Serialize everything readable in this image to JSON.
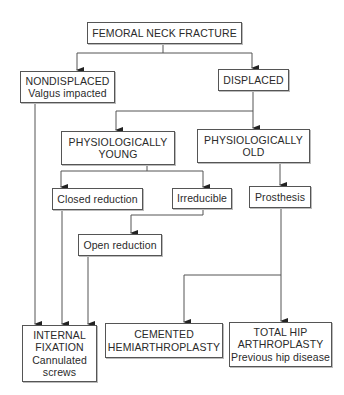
{
  "diagram": {
    "title": "FEMORAL NECK FRACTURE",
    "nodes": {
      "root": {
        "lines": [
          "FEMORAL NECK FRACTURE"
        ]
      },
      "nondisplaced": {
        "lines": [
          "NONDISPLACED",
          "Valgus impacted"
        ]
      },
      "displaced": {
        "lines": [
          "DISPLACED"
        ]
      },
      "young": {
        "lines": [
          "PHYSIOLOGICALLY",
          "YOUNG"
        ]
      },
      "old": {
        "lines": [
          "PHYSIOLOGICALLY",
          "OLD"
        ]
      },
      "closed_reduction": {
        "lines": [
          "Closed reduction"
        ]
      },
      "irreducible": {
        "lines": [
          "Irreducible"
        ]
      },
      "prosthesis": {
        "lines": [
          "Prosthesis"
        ]
      },
      "open_reduction": {
        "lines": [
          "Open reduction"
        ]
      },
      "internal_fixation": {
        "lines": [
          "INTERNAL",
          "FIXATION",
          "Cannulated",
          "screws"
        ]
      },
      "cemented": {
        "lines": [
          "CEMENTED",
          "HEMIARTHROPLASTY"
        ]
      },
      "total_hip": {
        "lines": [
          "TOTAL HIP",
          "ARTHROPLASTY",
          "Previous hip disease"
        ]
      }
    },
    "edges": [
      {
        "from": "root",
        "to": "nondisplaced"
      },
      {
        "from": "root",
        "to": "displaced"
      },
      {
        "from": "displaced",
        "to": "young"
      },
      {
        "from": "displaced",
        "to": "old"
      },
      {
        "from": "young",
        "to": "closed_reduction"
      },
      {
        "from": "young",
        "to": "irreducible"
      },
      {
        "from": "old",
        "to": "prosthesis"
      },
      {
        "from": "irreducible",
        "to": "open_reduction"
      },
      {
        "from": "nondisplaced",
        "to": "internal_fixation"
      },
      {
        "from": "closed_reduction",
        "to": "internal_fixation"
      },
      {
        "from": "open_reduction",
        "to": "internal_fixation"
      },
      {
        "from": "prosthesis",
        "to": "cemented"
      },
      {
        "from": "prosthesis",
        "to": "total_hip"
      }
    ],
    "colors": {
      "line": "#555555",
      "border": "#555555",
      "text": "#2a2a2a",
      "background": "#ffffff"
    }
  }
}
